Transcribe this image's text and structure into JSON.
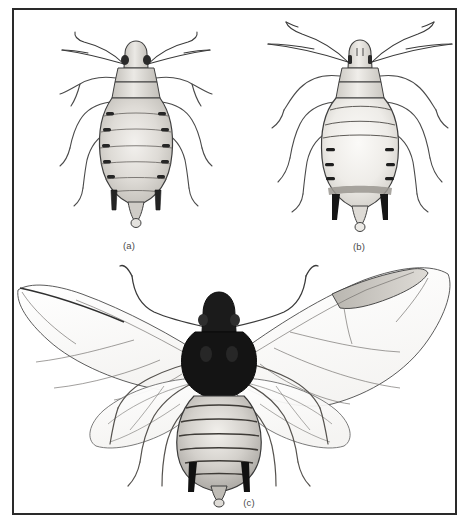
{
  "plate": {
    "kind": "scientific-illustration-plate",
    "subject": "aphid morphs, dorsal view",
    "background_color": "#ffffff",
    "frame_color": "#2a2a2a",
    "ink_color": "#2b2b2b",
    "body_fill": "#d8d6d2",
    "body_fill_light": "#eceae6",
    "dark_fill": "#1d1d1d",
    "wing_fill": "#fcfcfc"
  },
  "figures": [
    {
      "id": "a",
      "caption": "(a)",
      "type": "apterous-aphid",
      "description": "wingless aphid, dorsal view, dark segmental abdominal markings, short cornicles",
      "segments": 7,
      "legs": 6,
      "antennae": 2,
      "cornicles": 2
    },
    {
      "id": "b",
      "caption": "(b)",
      "type": "apterous-aphid",
      "description": "wingless aphid, dorsal view, pale abdomen with lateral sclerites and long dark cornicles",
      "segments": 7,
      "legs": 6,
      "antennae": 2,
      "cornicles": 2
    },
    {
      "id": "c",
      "caption": "(c)",
      "type": "alate-aphid",
      "description": "winged aphid, dorsal view, dark head and thorax, two pairs of membranous wings with pterostigma",
      "segments": 8,
      "legs": 6,
      "antennae": 2,
      "cornicles": 2,
      "wings": 4
    }
  ],
  "captions": {
    "a": "(a)",
    "b": "(b)",
    "c": "(c)"
  }
}
